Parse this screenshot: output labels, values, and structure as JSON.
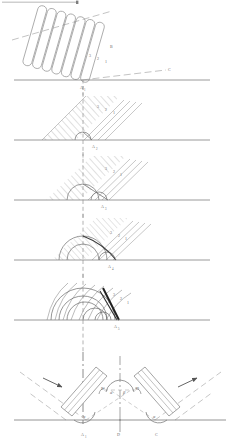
{
  "figure": {
    "ink_color": "#6b6b6b",
    "dark_ink": "#2a2a2a",
    "baseline_color": "#777777",
    "dashed_color": "#8a8a8a",
    "panels": [
      {
        "id": "panel-1",
        "caption": "incident-wave-train",
        "labels": [
          {
            "name": "wavefront-3",
            "text": "3",
            "x": 89,
            "y": 57
          },
          {
            "name": "wavefront-2",
            "text": "2",
            "x": 97,
            "y": 60
          },
          {
            "name": "wavefront-1",
            "text": "1",
            "x": 105,
            "y": 63
          },
          {
            "name": "point-B",
            "text": "B",
            "x": 110,
            "y": 48
          },
          {
            "name": "point-C",
            "text": "C",
            "x": 168,
            "y": 71
          },
          {
            "name": "point-A1",
            "text": "A",
            "x": 82,
            "y": 90
          },
          {
            "name": "point-A1-sub",
            "text": "1",
            "x": 85,
            "y": 92
          }
        ]
      },
      {
        "id": "panel-2",
        "caption": "first-secondary-wavelet",
        "labels": [
          {
            "name": "wavefront-3",
            "text": "3",
            "x": 97,
            "y": 108
          },
          {
            "name": "wavefront-2",
            "text": "2",
            "x": 105,
            "y": 111
          },
          {
            "name": "wavefront-1",
            "text": "1",
            "x": 113,
            "y": 114
          },
          {
            "name": "point-A2",
            "text": "A",
            "x": 95,
            "y": 148
          },
          {
            "name": "point-A2-sub",
            "text": "2",
            "x": 98,
            "y": 150
          }
        ]
      },
      {
        "id": "panel-3",
        "caption": "second-secondary-wavelet",
        "labels": [
          {
            "name": "wavefront-3",
            "text": "3",
            "x": 105,
            "y": 170
          },
          {
            "name": "wavefront-2",
            "text": "2",
            "x": 113,
            "y": 173
          },
          {
            "name": "wavefront-1",
            "text": "1",
            "x": 120,
            "y": 176
          },
          {
            "name": "point-A3",
            "text": "A",
            "x": 104,
            "y": 208
          },
          {
            "name": "point-A3-sub",
            "text": "3",
            "x": 107,
            "y": 210
          }
        ]
      },
      {
        "id": "panel-4",
        "caption": "third-secondary-wavelet",
        "labels": [
          {
            "name": "wavefront-3",
            "text": "3",
            "x": 110,
            "y": 234
          },
          {
            "name": "wavefront-2",
            "text": "2",
            "x": 118,
            "y": 237
          },
          {
            "name": "wavefront-1",
            "text": "1",
            "x": 125,
            "y": 240
          },
          {
            "name": "point-A4",
            "text": "A",
            "x": 110,
            "y": 268
          },
          {
            "name": "point-A4-sub",
            "text": "4",
            "x": 113,
            "y": 270
          }
        ]
      },
      {
        "id": "panel-5",
        "caption": "envelope-new-wavefront",
        "labels": [
          {
            "name": "wavefront-3",
            "text": "3",
            "x": 113,
            "y": 296
          },
          {
            "name": "wavefront-2",
            "text": "2",
            "x": 120,
            "y": 300
          },
          {
            "name": "wavefront-1",
            "text": "1",
            "x": 127,
            "y": 304
          },
          {
            "name": "point-A5",
            "text": "A",
            "x": 117,
            "y": 328
          },
          {
            "name": "point-A5-sub",
            "text": "5",
            "x": 120,
            "y": 330
          }
        ]
      },
      {
        "id": "panel-6",
        "caption": "symmetric-refraction-summary",
        "labels": [
          {
            "name": "point-B",
            "text": "B",
            "x": 103,
            "y": 390
          },
          {
            "name": "point-D",
            "text": "D",
            "x": 137,
            "y": 390
          },
          {
            "name": "angle-alpha-center",
            "text": "α",
            "x": 113,
            "y": 393
          },
          {
            "name": "angle-beta-center",
            "text": "β",
            "x": 124,
            "y": 393
          },
          {
            "name": "angle-alpha-left",
            "text": "α",
            "x": 92,
            "y": 419
          },
          {
            "name": "angle-alpha-right",
            "text": "α",
            "x": 152,
            "y": 419
          },
          {
            "name": "point-A1",
            "text": "A",
            "x": 84,
            "y": 436
          },
          {
            "name": "point-A1-sub",
            "text": "1",
            "x": 87,
            "y": 438
          },
          {
            "name": "point-D-base",
            "text": "D",
            "x": 119,
            "y": 436
          },
          {
            "name": "point-C-base",
            "text": "C",
            "x": 157,
            "y": 436
          }
        ]
      }
    ]
  }
}
